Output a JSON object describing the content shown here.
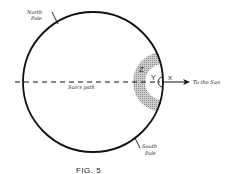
{
  "figure": {
    "caption": "FIG. 5",
    "labels": {
      "north_pole_line1": "North",
      "north_pole_line2": "Pole",
      "south_pole_line1": "South",
      "south_pole_line2": "Pole",
      "suns_path": "Sun's path",
      "to_the_sun": "To the Sun",
      "z": "Z",
      "y": "Y",
      "x": "X"
    },
    "colors": {
      "stroke": "#111111",
      "shading": "#b8b8b8",
      "background": "#ffffff"
    }
  }
}
